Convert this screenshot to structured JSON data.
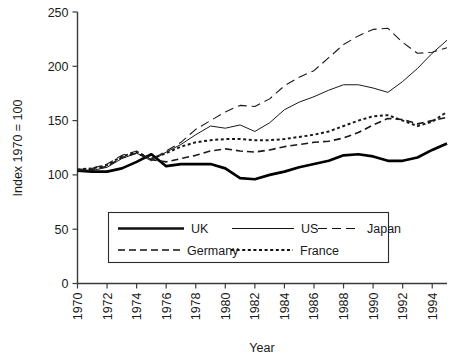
{
  "chart_data": {
    "type": "line",
    "title": "",
    "xlabel": "Year",
    "ylabel": "Index 1970 = 100",
    "xlim": [
      1970,
      1995
    ],
    "ylim": [
      0,
      250
    ],
    "yticks": [
      0,
      50,
      100,
      150,
      200,
      250
    ],
    "xticks": [
      1970,
      1972,
      1974,
      1976,
      1978,
      1980,
      1982,
      1984,
      1986,
      1988,
      1990,
      1992,
      1994
    ],
    "grid": false,
    "legend_position": "lower-center-inside",
    "x": [
      1970,
      1971,
      1972,
      1973,
      1974,
      1975,
      1976,
      1977,
      1978,
      1979,
      1980,
      1981,
      1982,
      1983,
      1984,
      1985,
      1986,
      1987,
      1988,
      1989,
      1990,
      1991,
      1992,
      1993,
      1994,
      1995
    ],
    "series": [
      {
        "name": "UK",
        "style": "solid-thick",
        "color": "#000000",
        "values": [
          104,
          103,
          103,
          106,
          112,
          119,
          108,
          110,
          110,
          110,
          106,
          97,
          96,
          100,
          103,
          107,
          110,
          113,
          118,
          119,
          117,
          113,
          113,
          116,
          123,
          129
        ]
      },
      {
        "name": "US",
        "style": "solid-thin",
        "color": "#1a1a1a",
        "values": [
          105,
          104,
          107,
          115,
          120,
          113,
          121,
          128,
          137,
          145,
          143,
          146,
          140,
          148,
          160,
          167,
          172,
          178,
          183,
          183,
          180,
          176,
          186,
          198,
          212,
          224
        ]
      },
      {
        "name": "Japan",
        "style": "dashed-long",
        "color": "#1a1a1a",
        "values": [
          105,
          106,
          110,
          118,
          122,
          114,
          122,
          130,
          142,
          150,
          158,
          164,
          163,
          170,
          182,
          190,
          196,
          208,
          220,
          228,
          234,
          235,
          222,
          212,
          213,
          217
        ]
      },
      {
        "name": "Germany",
        "style": "dashed-medium",
        "color": "#1a1a1a",
        "values": [
          104,
          105,
          108,
          116,
          120,
          114,
          112,
          115,
          118,
          122,
          124,
          122,
          121,
          123,
          126,
          128,
          130,
          131,
          134,
          139,
          146,
          152,
          151,
          147,
          150,
          153
        ]
      },
      {
        "name": "France",
        "style": "dotted",
        "color": "#1a1a1a",
        "values": [
          105,
          106,
          109,
          117,
          121,
          115,
          120,
          126,
          130,
          132,
          133,
          133,
          132,
          132,
          133,
          135,
          137,
          140,
          145,
          150,
          154,
          155,
          150,
          145,
          149,
          158
        ]
      }
    ]
  },
  "axis": {
    "y_title": "Index 1970 = 100",
    "x_title": "Year",
    "y_tick_labels": [
      "250",
      "200",
      "150",
      "100",
      "50",
      "0"
    ],
    "x_tick_labels": [
      "1970",
      "1972",
      "1974",
      "1976",
      "1978",
      "1980",
      "1982",
      "1984",
      "1986",
      "1988",
      "1990",
      "1992",
      "1994"
    ]
  },
  "legend": {
    "row1": [
      {
        "label": "UK",
        "style": "solid-thick"
      },
      {
        "label": "US",
        "style": "solid-thin"
      },
      {
        "label": "Japan",
        "style": "dashed-long"
      }
    ],
    "row2": [
      {
        "label": "Germany",
        "style": "dashed-medium"
      },
      {
        "label": "France",
        "style": "dotted"
      }
    ]
  }
}
